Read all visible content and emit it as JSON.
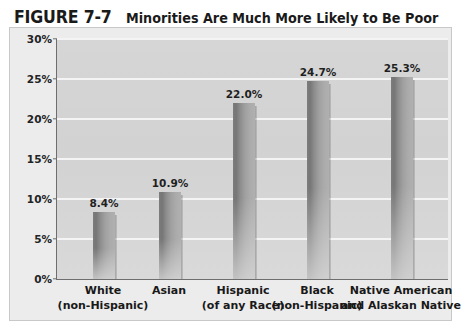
{
  "figure": {
    "number": "FIGURE 7-7",
    "caption": "Minorities Are Much More Likely to Be Poor"
  },
  "chart_data": {
    "type": "bar",
    "title": "FIGURE 7-7 Minorities Are Much More Likely to Be Poor",
    "xlabel": "",
    "ylabel": "",
    "ylim": [
      0,
      30
    ],
    "ytick_step": 5,
    "grid": "horizontal",
    "legend": "none",
    "ytick_labels": [
      "0%",
      "5%",
      "10%",
      "15%",
      "20%",
      "25%",
      "30%"
    ],
    "categories": [
      "White (non-Hispanic)",
      "Asian",
      "Hispanic (of any Race)",
      "Black (non-Hispanic)",
      "Native American and Alaskan Native"
    ],
    "category_lines": [
      [
        "White",
        "(non-Hispanic)"
      ],
      [
        "Asian",
        ""
      ],
      [
        "Hispanic",
        "(of any Race)"
      ],
      [
        "Black",
        "(non-Hispanic)"
      ],
      [
        "Native American",
        "and Alaskan Native"
      ]
    ],
    "values": [
      8.4,
      10.9,
      22.0,
      24.7,
      25.3
    ],
    "value_labels": [
      "8.4%",
      "10.9%",
      "22.0%",
      "24.7%",
      "25.3%"
    ]
  },
  "colors": {
    "page_background": "#ffffff",
    "frame_background": "#ececec",
    "frame_border": "#c8c8c8",
    "plot_background": "#d4d4d4",
    "gridline": "#f4f4f4",
    "axis_line": "#6e6e6e",
    "bar_dark": "#767676",
    "bar_light": "#b0b0b0",
    "text": "#1a1a1a"
  }
}
